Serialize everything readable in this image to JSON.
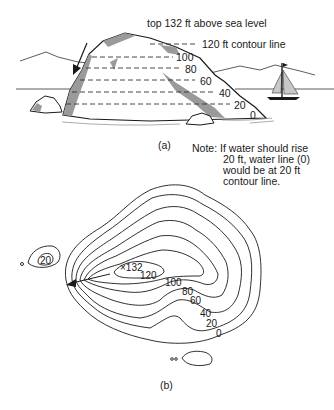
{
  "figure_a": {
    "top_label": "top 132 ft above sea level",
    "contour_120_label": "120 ft contour line",
    "contour_labels": [
      "100",
      "80",
      "60",
      "40",
      "20",
      "0"
    ],
    "caption": "(a)"
  },
  "note": {
    "line1": "Note: If water should rise",
    "line2": "20 ft, water line (0)",
    "line3": "would be at 20 ft",
    "line4": "contour line."
  },
  "figure_b": {
    "summit_label": "×132",
    "contour_labels": [
      "120",
      "100",
      "80",
      "60",
      "40",
      "20",
      "0"
    ],
    "islet_label": "20",
    "caption": "(b)"
  },
  "colors": {
    "ink": "#1a1a1a",
    "shade": "#9a9a9a",
    "sail": "#c8c8c8"
  }
}
